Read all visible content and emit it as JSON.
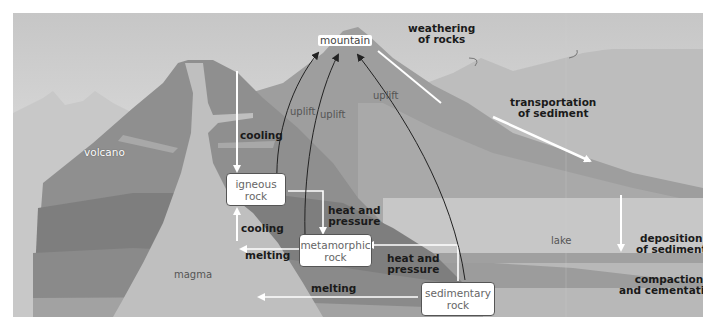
{
  "diagram": {
    "landforms": {
      "mountain": "mountain",
      "volcano": "volcano",
      "magma": "magma",
      "lake": "lake"
    },
    "rock_boxes": {
      "igneous": "igneous rock",
      "igneous_line1": "igneous",
      "igneous_line2": "rock",
      "metamorphic_line1": "metamorphic",
      "metamorphic_line2": "rock",
      "sedimentary_line1": "sedimentary",
      "sedimentary_line2": "rock"
    },
    "processes": {
      "weathering_line1": "weathering",
      "weathering_line2": "of rocks",
      "transportation_line1": "transportation",
      "transportation_line2": "of sediment",
      "deposition_line1": "deposition",
      "deposition_line2": "of sediment",
      "compaction_line1": "compaction",
      "compaction_line2": "and cementation",
      "cooling_top": "cooling",
      "cooling_bottom": "cooling",
      "heat_pressure_1_line1": "heat and",
      "heat_pressure_1_line2": "pressure",
      "heat_pressure_2_line1": "heat and",
      "heat_pressure_2_line2": "pressure",
      "melting_meta": "melting",
      "melting_sed": "melting",
      "uplift_1": "uplift",
      "uplift_2": "uplift",
      "uplift_3": "uplift"
    },
    "colors": {
      "sky_top": "#c9c9c9",
      "sky_bottom": "#ececec",
      "far_hills": "#c4c4c4",
      "mountain": "#9d9d9d",
      "volcano": "#8c8c8c",
      "volcano_dark": "#7e7e7e",
      "magma": "#c0c0c0",
      "lake": "#c6c6c6",
      "sediment_layer": "#a8a8a8",
      "deep_layer": "#b2b2b2",
      "arrow_white": "#ffffff",
      "arrow_black": "#222222"
    }
  }
}
